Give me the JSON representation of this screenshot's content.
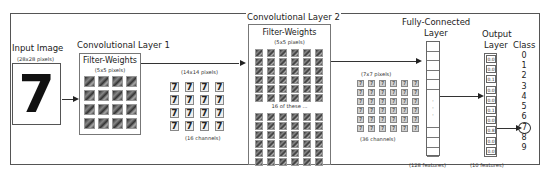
{
  "diagram": {
    "input": {
      "title": "Input Image",
      "subtitle": "(28x28 pixels)",
      "digit": "7"
    },
    "conv1": {
      "title": "Convolutional Layer 1",
      "filter_title": "Filter-Weights",
      "filter_subtitle": "(5x5 pixels)",
      "output_size": "(14x14 pixels)",
      "channels": "(16 channels)",
      "digit": "7"
    },
    "conv2": {
      "title": "Convolutional Layer 2",
      "filter_title": "Filter-Weights",
      "filter_subtitle": "(5x5 pixels)",
      "repeat_note": "16 of these ...",
      "output_size": "(7x7 pixels)",
      "channels": "(36 channels)"
    },
    "fc": {
      "title_line1": "Fully-Connected",
      "title_line2": "Layer",
      "features": "(128 features)",
      "ellipsis": "·"
    },
    "output": {
      "title_line1": "Output",
      "title_line2": "Layer",
      "features": "(10 features)",
      "values": [
        "0.0",
        "0.0",
        "0.1",
        "0.0",
        "0.0",
        "0.1",
        "0.0",
        "0.8",
        "0.0",
        "0.0"
      ]
    },
    "class": {
      "title": "Class",
      "labels": [
        "0",
        "1",
        "2",
        "3",
        "4",
        "5",
        "6",
        "7",
        "8",
        "9"
      ],
      "predicted": "7"
    },
    "colors": {
      "line": "#333333",
      "frame": "#555555",
      "box_border": "#777777"
    }
  }
}
